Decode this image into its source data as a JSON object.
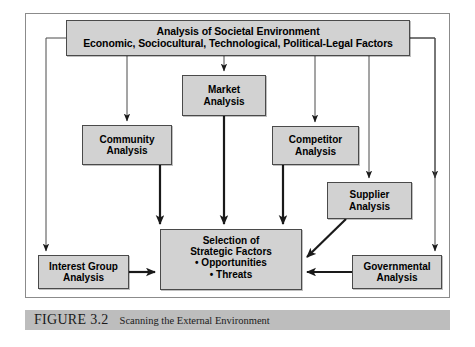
{
  "figure": {
    "number": "FIGURE 3.2",
    "title": "Scanning the External Environment"
  },
  "diagram": {
    "type": "flowchart",
    "nodes": [
      {
        "id": "societal",
        "line1": "Analysis of Societal Environment",
        "line2": "Economic, Sociocultural, Technological, Political-Legal Factors"
      },
      {
        "id": "market",
        "line1": "Market",
        "line2": "Analysis"
      },
      {
        "id": "community",
        "line1": "Community",
        "line2": "Analysis"
      },
      {
        "id": "competitor",
        "line1": "Competitor",
        "line2": "Analysis"
      },
      {
        "id": "supplier",
        "line1": "Supplier",
        "line2": "Analysis"
      },
      {
        "id": "interest_group",
        "line1": "Interest Group",
        "line2": "Analysis"
      },
      {
        "id": "governmental",
        "line1": "Governmental",
        "line2": "Analysis"
      },
      {
        "id": "selection",
        "line1": "Selection of",
        "line2": "Strategic Factors",
        "bullet1": "• Opportunities",
        "bullet2": "• Threats"
      }
    ],
    "edges": [
      {
        "from": "societal",
        "to": "community"
      },
      {
        "from": "societal",
        "to": "market"
      },
      {
        "from": "societal",
        "to": "competitor"
      },
      {
        "from": "societal",
        "to": "supplier"
      },
      {
        "from": "societal",
        "to": "interest_group"
      },
      {
        "from": "societal",
        "to": "governmental"
      },
      {
        "from": "community",
        "to": "selection"
      },
      {
        "from": "market",
        "to": "selection"
      },
      {
        "from": "competitor",
        "to": "selection"
      },
      {
        "from": "supplier",
        "to": "selection"
      },
      {
        "from": "interest_group",
        "to": "selection"
      },
      {
        "from": "governmental",
        "to": "selection"
      }
    ],
    "colors": {
      "node_fill": "#d2d2d2",
      "node_border": "#4a4a4a",
      "frame_border": "#8b8b8b",
      "caption_bar": "#bdbdbd",
      "connector": "#1a1a1a",
      "page_background": "#ffffff"
    }
  }
}
